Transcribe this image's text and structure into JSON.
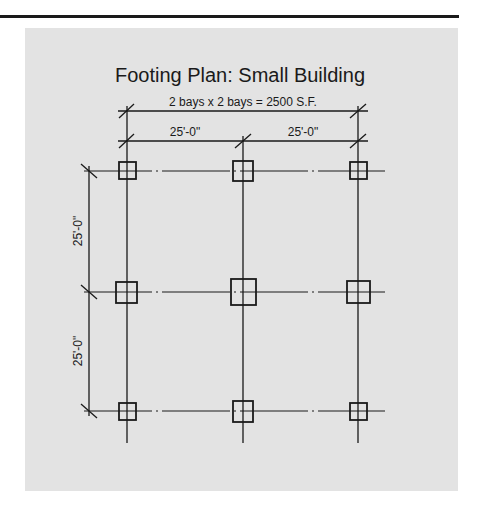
{
  "diagram": {
    "title": "Footing Plan: Small Building",
    "summary": "2 bays x 2 bays = 2500 S.F.",
    "bay_dims_horizontal": [
      "25'-0\"",
      "25'-0\""
    ],
    "bay_dims_vertical": [
      "25'-0\"",
      "25'-0\""
    ],
    "grid": {
      "columns_x": [
        127,
        243,
        358
      ],
      "rows_y": [
        171,
        292,
        411
      ]
    },
    "footings": [
      {
        "row": 0,
        "col": 0,
        "size": "small"
      },
      {
        "row": 0,
        "col": 1,
        "size": "medium"
      },
      {
        "row": 0,
        "col": 2,
        "size": "small"
      },
      {
        "row": 1,
        "col": 0,
        "size": "medium"
      },
      {
        "row": 1,
        "col": 1,
        "size": "large"
      },
      {
        "row": 1,
        "col": 2,
        "size": "medium"
      },
      {
        "row": 2,
        "col": 0,
        "size": "small"
      },
      {
        "row": 2,
        "col": 1,
        "size": "medium"
      },
      {
        "row": 2,
        "col": 2,
        "size": "small"
      }
    ],
    "colors": {
      "line": "#1a1a1a",
      "panel": "#e3e3e3",
      "rule": "#1a1a1a"
    }
  }
}
